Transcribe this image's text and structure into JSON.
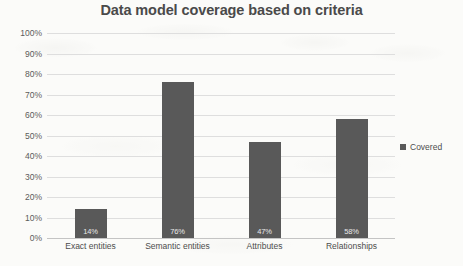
{
  "chart_data": {
    "type": "bar",
    "title": "Data model coverage based on criteria",
    "xlabel": "",
    "ylabel": "",
    "categories": [
      "Exact entities",
      "Semantic entities",
      "Attributes",
      "Relationships"
    ],
    "values": [
      14,
      76,
      47,
      58
    ],
    "value_labels": [
      "14%",
      "76%",
      "47%",
      "58%"
    ],
    "series": [
      {
        "name": "Covered",
        "values": [
          14,
          76,
          47,
          58
        ],
        "color": "#595959"
      }
    ],
    "ylim": [
      0,
      100
    ],
    "ytick_values": [
      100,
      90,
      80,
      70,
      60,
      50,
      40,
      30,
      20,
      10,
      0
    ],
    "ytick_labels": [
      "100%",
      "90%",
      "80%",
      "70%",
      "60%",
      "50%",
      "40%",
      "30%",
      "20%",
      "10%",
      "0%"
    ],
    "grid": true,
    "legend_position": "right",
    "legend_entries": [
      "Covered"
    ],
    "colors": {
      "bar": "#595959",
      "gridline": "#dedede",
      "axis": "#c4c4c4",
      "title_text": "#4a4a4a",
      "tick_text": "#5b5b5b",
      "value_label_text": "#e8e8e8",
      "background": "#fbfbf9"
    }
  }
}
